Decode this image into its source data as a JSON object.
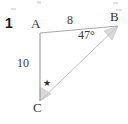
{
  "figure": {
    "problem_number": "1",
    "type": "triangle-diagram",
    "vertices": [
      {
        "name": "A",
        "label": "A",
        "x": 40,
        "y": 33
      },
      {
        "name": "B",
        "label": "B",
        "x": 118,
        "y": 26
      },
      {
        "name": "C",
        "label": "C",
        "x": 40,
        "y": 101
      }
    ],
    "vertex_labels": [
      {
        "label": "A",
        "left": 31,
        "top": 17
      },
      {
        "label": "B",
        "left": 110,
        "top": 10
      },
      {
        "label": "C",
        "left": 33,
        "top": 101
      }
    ],
    "sides": [
      {
        "name": "AB",
        "label": "8",
        "from": "A",
        "to": "B",
        "left": 67,
        "top": 14
      },
      {
        "name": "AC",
        "label": "10",
        "from": "A",
        "to": "C",
        "left": 17,
        "top": 57
      },
      {
        "name": "BC",
        "label": "",
        "from": "B",
        "to": "C",
        "left": 0,
        "top": 0
      }
    ],
    "angles": [
      {
        "name": "angle-B",
        "vertex": "B",
        "label": "47°",
        "left": 78,
        "top": 29,
        "marked": true,
        "unknown": false
      },
      {
        "name": "angle-C",
        "vertex": "C",
        "label": "★",
        "left": 43,
        "top": 79,
        "marked": true,
        "unknown": true
      }
    ],
    "colors": {
      "line": "#b4b4b4",
      "line_dark": "#9a9a9a",
      "sector_fill": "#d9d9d9",
      "text": "#2b2b2b",
      "background": "#ffffff"
    }
  }
}
